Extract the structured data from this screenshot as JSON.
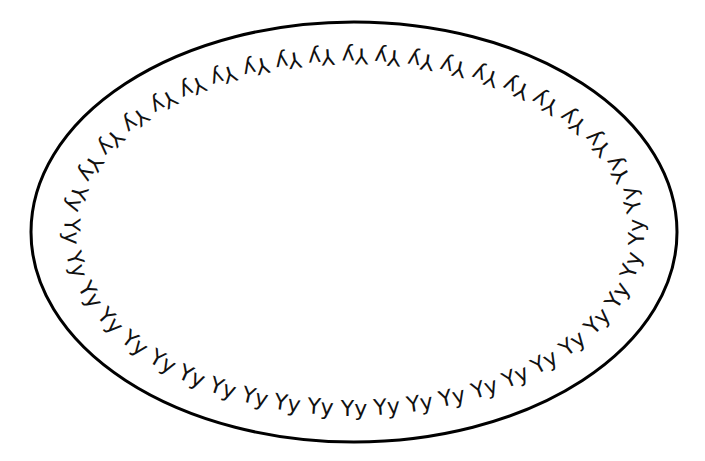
{
  "diagram": {
    "type": "cell-membrane-with-receptors",
    "outer_ellipse": {
      "cx": 354,
      "cy": 232,
      "rx": 323,
      "ry": 210,
      "stroke": "#000000",
      "stroke_width": 3
    },
    "label_ring": {
      "cx": 354,
      "cy": 232,
      "rx": 282,
      "ry": 176
    },
    "glyph": "Yy",
    "glyph_count": 44,
    "glyph_color": "#111111"
  }
}
